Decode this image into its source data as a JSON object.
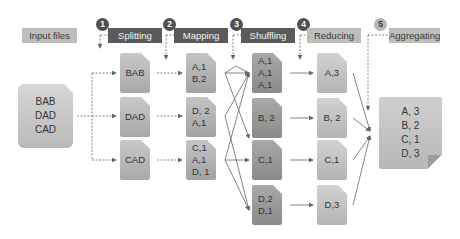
{
  "headers": {
    "input": "Input files",
    "steps": [
      {
        "num": "1",
        "label": "Splitting",
        "style": "dark"
      },
      {
        "num": "2",
        "label": "Mapping",
        "style": "dark"
      },
      {
        "num": "3",
        "label": "Shuffling",
        "style": "dark"
      },
      {
        "num": "4",
        "label": "Reducing",
        "style": "light"
      },
      {
        "num": "5",
        "label": "Aggregating",
        "style": "light"
      }
    ]
  },
  "input_file": {
    "lines": [
      "BAB",
      "DAD",
      "CAD"
    ]
  },
  "splitting": [
    {
      "lines": [
        "BAB"
      ]
    },
    {
      "lines": [
        "DAD"
      ]
    },
    {
      "lines": [
        "CAD"
      ]
    }
  ],
  "mapping": [
    {
      "lines": [
        "A,1",
        "B,2"
      ]
    },
    {
      "lines": [
        "D, 2",
        "A,1"
      ]
    },
    {
      "lines": [
        "C,1",
        "A,1",
        "D, 1"
      ]
    }
  ],
  "shuffling": [
    {
      "lines": [
        "A,1",
        "A,1",
        "A,1"
      ]
    },
    {
      "lines": [
        "B, 2"
      ]
    },
    {
      "lines": [
        "C,1"
      ]
    },
    {
      "lines": [
        "D,2",
        "D,1"
      ]
    }
  ],
  "reducing": [
    {
      "lines": [
        "A,3"
      ]
    },
    {
      "lines": [
        "B, 2"
      ]
    },
    {
      "lines": [
        "C,1"
      ]
    },
    {
      "lines": [
        "D,3"
      ]
    }
  ],
  "aggregating": {
    "lines": [
      "A, 3",
      "B, 2",
      "C, 1",
      "D, 3"
    ]
  },
  "colors": {
    "dark_header": "#5a5a5a",
    "light_header": "#bdbdbd",
    "arrow": "#666666"
  }
}
